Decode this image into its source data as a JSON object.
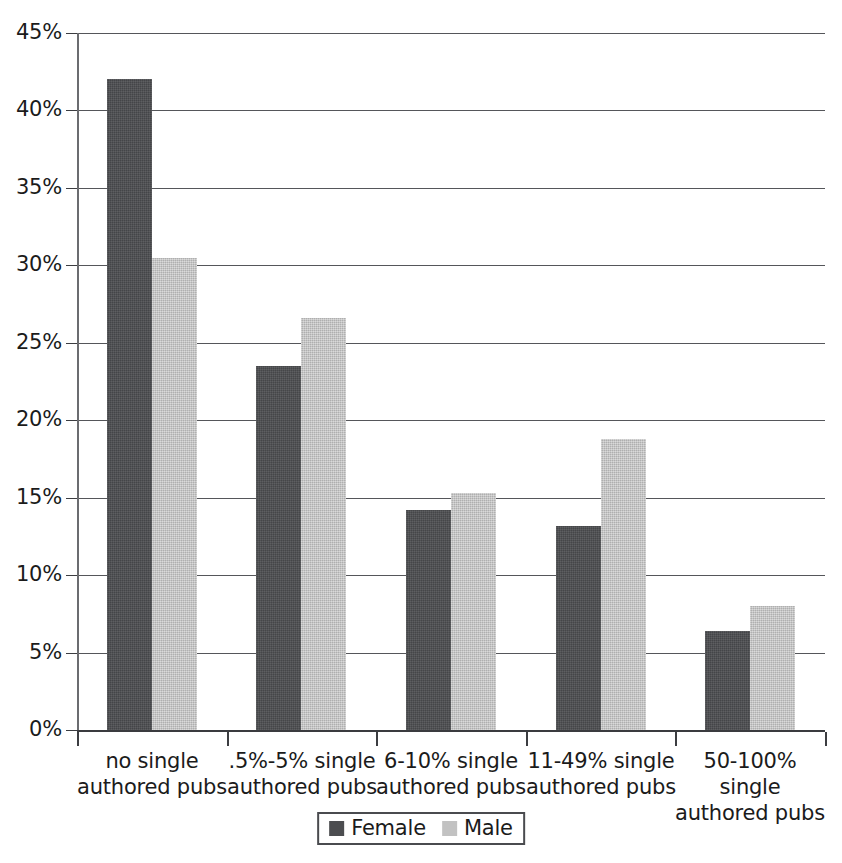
{
  "chart_data": {
    "type": "bar",
    "title": "",
    "subtitle": "",
    "xlabel": "",
    "ylabel": "",
    "categories": [
      "no single authored pubs",
      ".5%-5% single authored pubs",
      "6-10% single authored pubs",
      "11-49% single authored pubs",
      "50-100% single authored pubs"
    ],
    "category_lines": [
      [
        "no single",
        "authored pubs"
      ],
      [
        ".5%-5% single",
        "authored pubs"
      ],
      [
        "6-10% single",
        "authored pubs"
      ],
      [
        "11-49% single",
        "authored pubs"
      ],
      [
        "50-100% single",
        "authored pubs"
      ]
    ],
    "series": [
      {
        "name": "Female",
        "color": "#4c4d50",
        "values": [
          42.0,
          23.5,
          14.2,
          13.2,
          6.4
        ]
      },
      {
        "name": "Male",
        "color": "#c2c2c2",
        "values": [
          30.5,
          26.6,
          15.3,
          18.8,
          8.0
        ]
      }
    ],
    "ylim": [
      0,
      45
    ],
    "ytick_values": [
      0,
      5,
      10,
      15,
      20,
      25,
      30,
      35,
      40,
      45
    ],
    "ytick_labels": [
      "0%",
      "5%",
      "10%",
      "15%",
      "20%",
      "25%",
      "30%",
      "35%",
      "40%",
      "45%"
    ],
    "grid": true,
    "grid_axis": "y",
    "legend_position": "bottom",
    "legend_entries": [
      "Female",
      "Male"
    ],
    "value_format": "percent"
  }
}
